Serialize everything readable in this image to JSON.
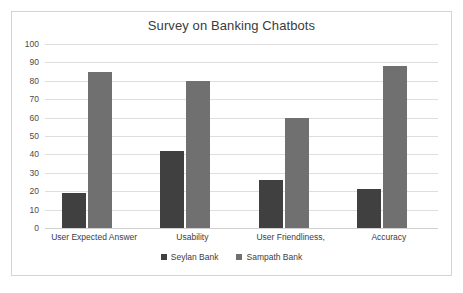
{
  "chart_data": {
    "type": "bar",
    "title": "Survey on Banking Chatbots",
    "xlabel": "",
    "ylabel": "",
    "ylim": [
      0,
      100
    ],
    "ytick_step": 10,
    "yticks": [
      "100",
      "90",
      "80",
      "70",
      "60",
      "50",
      "40",
      "30",
      "20",
      "10",
      "0"
    ],
    "grid": true,
    "legend_position": "bottom",
    "categories": [
      "User Expected Answer",
      "Usability",
      "User Friendliness,",
      "Accuracy"
    ],
    "series": [
      {
        "name": "Seylan Bank",
        "color": "#404040",
        "values": [
          19,
          42,
          26,
          21
        ]
      },
      {
        "name": "Sampath Bank",
        "color": "#707070",
        "values": [
          85,
          80,
          60,
          88
        ]
      }
    ]
  },
  "colors": {
    "series_seylan": "#404040",
    "series_sampath": "#707070",
    "gridline": "#dedede",
    "frame_border": "#d4d4d4",
    "title_text": "#3b3b3b",
    "axis_text": "#4a4a4a",
    "background": "#ffffff"
  }
}
